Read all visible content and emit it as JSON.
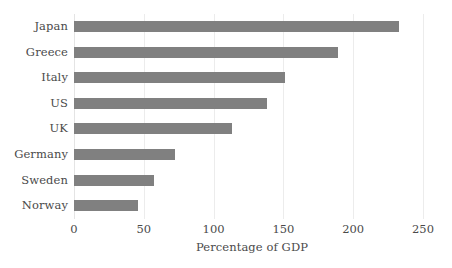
{
  "chart_data": {
    "type": "bar",
    "orientation": "horizontal",
    "title": "",
    "subtitle": "",
    "xlabel": "Percentage of GDP",
    "ylabel": "",
    "categories": [
      "Japan",
      "Greece",
      "Italy",
      "US",
      "UK",
      "Germany",
      "Sweden",
      "Norway"
    ],
    "values": [
      233,
      189,
      151,
      138,
      113,
      72,
      57,
      46
    ],
    "series": [
      {
        "name": "Percentage of GDP",
        "values": [
          233,
          189,
          151,
          138,
          113,
          72,
          57,
          46
        ]
      }
    ],
    "xlim": [
      0,
      250
    ],
    "xticks": [
      0,
      50,
      100,
      150,
      200,
      250
    ],
    "xtick_labels": [
      "0",
      "50",
      "100",
      "150",
      "200",
      "250"
    ],
    "grid": "vertical-faint",
    "legend": "none",
    "bar_color": "#808080",
    "gridline_color": "#ececec",
    "text_color": "#4a4a4a",
    "background_color": "#ffffff"
  }
}
